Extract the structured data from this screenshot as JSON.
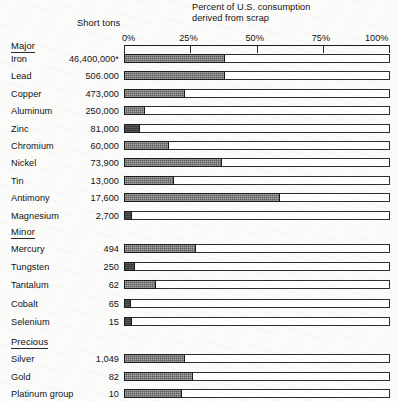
{
  "header": {
    "chart_title": "Percent of U.S. consumption derived from scrap",
    "chart_title_line1": "Percent of U.S. consumption",
    "chart_title_line2": "derived from scrap",
    "value_column_header": "Short tons"
  },
  "axis": {
    "ticks": [
      "0%",
      "25%",
      "50%",
      "75%",
      "100%"
    ],
    "tick_values": [
      0,
      25,
      50,
      75,
      100
    ],
    "min": 0,
    "max": 100
  },
  "groups": [
    {
      "title": "Major"
    },
    {
      "title": "Minor"
    },
    {
      "title": "Precious"
    }
  ],
  "chart_data": {
    "type": "bar",
    "orientation": "horizontal",
    "title": "Percent of U.S. consumption derived from scrap",
    "xlabel": "Percent of U.S. consumption derived from scrap",
    "ylabel": "",
    "xlim": [
      0,
      100
    ],
    "grid": false,
    "legend": "none",
    "xticks": [
      0,
      25,
      50,
      75,
      100
    ],
    "xticklabels": [
      "0%",
      "25%",
      "50%",
      "75%",
      "100%"
    ],
    "value_column_header": "Short tons",
    "footnote_marker": "*",
    "groups": [
      {
        "name": "Major",
        "categories": [
          "Iron",
          "Lead",
          "Copper",
          "Aluminum",
          "Zinc",
          "Chromium",
          "Nickel",
          "Tin",
          "Antimony",
          "Magnesium"
        ],
        "short_tons": [
          "46,400,000*",
          "506.000",
          "473,000",
          "250,000",
          "81,000",
          "60,000",
          "73,900",
          "13,000",
          "17,600",
          "2,700"
        ],
        "values": [
          38,
          38,
          23,
          8,
          6,
          17,
          37,
          19,
          59,
          3
        ]
      },
      {
        "name": "Minor",
        "categories": [
          "Mercury",
          "Tungsten",
          "Tantalum",
          "Cobalt",
          "Selenium"
        ],
        "short_tons": [
          "494",
          "250",
          "62",
          "65",
          "15"
        ],
        "values": [
          27,
          4,
          12,
          1,
          3
        ]
      },
      {
        "name": "Precious",
        "categories": [
          "Silver",
          "Gold",
          "Platinum group"
        ],
        "short_tons": [
          "1,049",
          "82",
          "10"
        ],
        "values": [
          23,
          26,
          22
        ]
      }
    ]
  }
}
